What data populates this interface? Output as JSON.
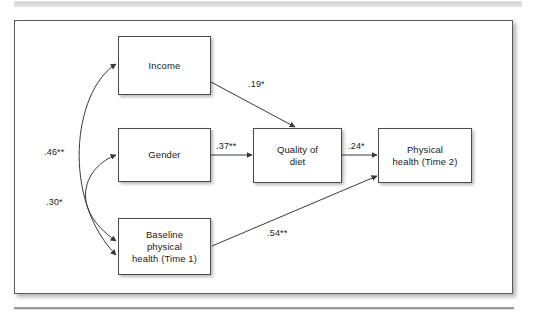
{
  "figure": {
    "type": "path-diagram",
    "nodes": [
      {
        "id": "income",
        "label": "Income"
      },
      {
        "id": "gender",
        "label": "Gender"
      },
      {
        "id": "baseline",
        "label": "Baseline\nphysical\nhealth (Time 1)"
      },
      {
        "id": "quality",
        "label": "Quality of\ndiet"
      },
      {
        "id": "physical",
        "label": "Physical\nhealth (Time 2)"
      }
    ],
    "paths": [
      {
        "id": "income-quality",
        "from": "income",
        "to": "quality",
        "coefficient": ".19*",
        "style": "straight"
      },
      {
        "id": "gender-quality",
        "from": "gender",
        "to": "quality",
        "coefficient": ".37**",
        "style": "straight"
      },
      {
        "id": "quality-physical",
        "from": "quality",
        "to": "physical",
        "coefficient": ".24*",
        "style": "straight"
      },
      {
        "id": "baseline-physical",
        "from": "baseline",
        "to": "physical",
        "coefficient": ".54**",
        "style": "straight"
      },
      {
        "id": "income-baseline",
        "from": "income",
        "to": "baseline",
        "coefficient": ".46**",
        "style": "curved-double"
      },
      {
        "id": "gender-baseline",
        "from": "gender",
        "to": "baseline",
        "coefficient": ".30*",
        "style": "curved-double"
      }
    ],
    "colors": {
      "frame_border": "#5a5a5a",
      "box_border": "#4a4a4a",
      "line": "#3a3a3a",
      "background": "#ffffff",
      "text": "#1a1a1a"
    }
  }
}
